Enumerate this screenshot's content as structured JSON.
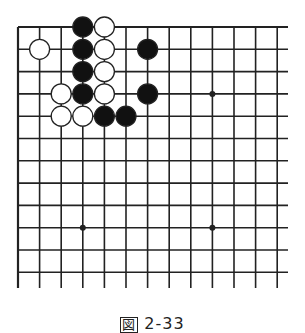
{
  "diagram": {
    "type": "go-board-partial",
    "grid": {
      "columns": 13,
      "rows": 12,
      "x0": 18,
      "y0": 27,
      "dx": 21.6,
      "dy": 22.3,
      "right_extent": 288,
      "bottom_extent": 288,
      "line_color": "#222222"
    },
    "star_points": [
      {
        "col": 9,
        "row": 3
      },
      {
        "col": 3,
        "row": 9
      },
      {
        "col": 9,
        "row": 9
      }
    ],
    "stones": [
      {
        "color": "black",
        "col": 3,
        "row": 0
      },
      {
        "color": "white",
        "col": 4,
        "row": 0
      },
      {
        "color": "white",
        "col": 1,
        "row": 1
      },
      {
        "color": "black",
        "col": 3,
        "row": 1
      },
      {
        "color": "white",
        "col": 4,
        "row": 1
      },
      {
        "color": "black",
        "col": 6,
        "row": 1
      },
      {
        "color": "black",
        "col": 3,
        "row": 2
      },
      {
        "color": "white",
        "col": 4,
        "row": 2
      },
      {
        "color": "white",
        "col": 2,
        "row": 3
      },
      {
        "color": "black",
        "col": 3,
        "row": 3
      },
      {
        "color": "white",
        "col": 4,
        "row": 3
      },
      {
        "color": "black",
        "col": 6,
        "row": 3
      },
      {
        "color": "white",
        "col": 2,
        "row": 4
      },
      {
        "color": "white",
        "col": 3,
        "row": 4
      },
      {
        "color": "black",
        "col": 4,
        "row": 4
      },
      {
        "color": "black",
        "col": 5,
        "row": 4
      }
    ],
    "stone_radius": 10,
    "colors": {
      "black": "#111111",
      "white": "#ffffff",
      "stroke": "#222222"
    }
  },
  "caption": {
    "prefix": "図",
    "label": "2-33"
  }
}
